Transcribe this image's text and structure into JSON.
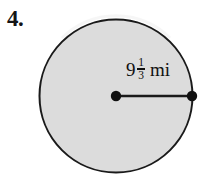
{
  "problem": {
    "number": "4."
  },
  "figure": {
    "shape_name": "circle",
    "fill_color": "#dcdcdc",
    "stroke_color": "#1a1a1a",
    "center_x": 116,
    "center_y": 96,
    "radius": 77,
    "center_point_label": "center-point",
    "edge_point_label": "radius-endpoint"
  },
  "measurement": {
    "whole": "9",
    "numerator": "1",
    "denominator": "3",
    "unit": "mi",
    "full_text": "9 1/3 mi",
    "measure_type": "radius"
  }
}
